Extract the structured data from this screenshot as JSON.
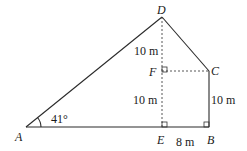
{
  "diagram": {
    "type": "geometry-figure",
    "points": {
      "A": {
        "label": "A",
        "x": 26,
        "y": 127
      },
      "E": {
        "label": "E",
        "x": 162,
        "y": 127
      },
      "B": {
        "label": "B",
        "x": 209,
        "y": 127
      },
      "D": {
        "label": "D",
        "x": 162,
        "y": 17
      },
      "C": {
        "label": "C",
        "x": 209,
        "y": 71
      },
      "F": {
        "label": "F",
        "x": 162,
        "y": 71
      }
    },
    "measurements": {
      "DF": "10 m",
      "FE": "10 m",
      "CB": "10 m",
      "EB": "8 m",
      "angle_A": "41°"
    },
    "right_angles": [
      "F",
      "E",
      "B"
    ],
    "solid_segments": [
      "AD",
      "DC",
      "CB",
      "AB"
    ],
    "dashed_segments": [
      "DE",
      "FC"
    ]
  }
}
